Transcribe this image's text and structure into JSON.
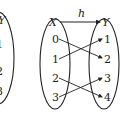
{
  "diagram": {
    "function_label": "h",
    "domain_label": "X",
    "codomain_label": "Y",
    "domain_elements": [
      "0",
      "1",
      "2",
      "3"
    ],
    "codomain_elements": [
      "1",
      "2",
      "3",
      "4"
    ],
    "mappings": [
      {
        "from": "0",
        "to": "2"
      },
      {
        "from": "1",
        "to": "1"
      },
      {
        "from": "2",
        "to": "4"
      },
      {
        "from": "3",
        "to": "3"
      }
    ],
    "left_partial": {
      "set_label": "Y",
      "elements": [
        "1",
        "2",
        "3"
      ]
    }
  }
}
